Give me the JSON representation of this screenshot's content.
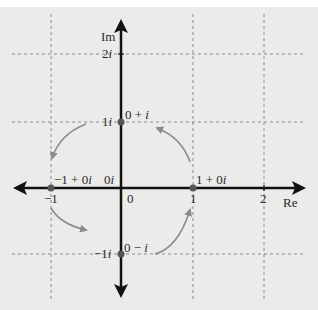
{
  "figure": {
    "axes": {
      "x_label": "Re",
      "y_label": "Im",
      "x_ticks": [
        "−1",
        "0",
        "1",
        "2"
      ],
      "y_ticks": [
        "2i",
        "1i",
        "−1i"
      ]
    },
    "points": [
      {
        "name": "one",
        "label": "1 + 0i",
        "re": 1,
        "im": 0
      },
      {
        "name": "i",
        "label": "0 + i",
        "re": 0,
        "im": 1
      },
      {
        "name": "minus-one",
        "label": "−1 + 0i",
        "re": -1,
        "im": 0
      },
      {
        "name": "minus-i",
        "label": "0 − i",
        "re": 0,
        "im": -1
      }
    ],
    "origin_label": "0i",
    "rotation_arrows": [
      {
        "from": "1 + 0i",
        "to": "0 + i"
      },
      {
        "from": "0 + i",
        "to": "−1 + 0i"
      },
      {
        "from": "−1 + 0i",
        "to": "0 − i"
      },
      {
        "from": "0 − i",
        "to": "1 + 0i"
      }
    ],
    "colors": {
      "background": "#ebebea",
      "axis": "#111111",
      "grid": "#8a8a8a",
      "curve": "#8c8c8c",
      "point": "#555555"
    }
  }
}
